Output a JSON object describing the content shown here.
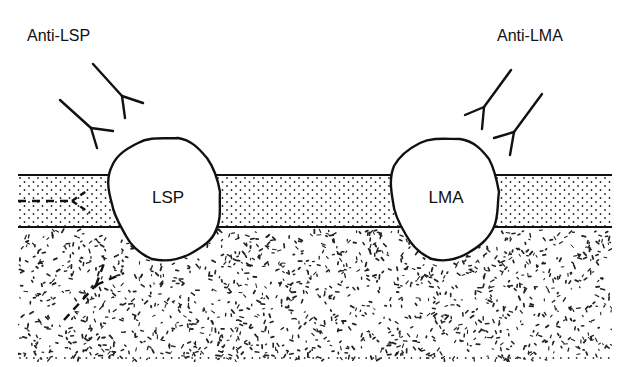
{
  "diagram": {
    "type": "schematic",
    "labels": {
      "anti_lsp": "Anti-LSP",
      "anti_lma": "Anti-LMA",
      "lsp": "LSP",
      "lma": "LMA"
    },
    "colors": {
      "ink": "#111111",
      "background": "#ffffff"
    },
    "layers": [
      {
        "name": "membrane-band",
        "pattern": "fine-dots",
        "top": 175,
        "bottom": 227
      },
      {
        "name": "underlying-matrix",
        "pattern": "random-speckle",
        "top": 227,
        "bottom": 360
      }
    ],
    "antigens": [
      {
        "id": "lsp",
        "label": "LSP",
        "cx": 166,
        "cy": 197
      },
      {
        "id": "lma",
        "label": "LMA",
        "cx": 446,
        "cy": 196
      }
    ],
    "antibodies": [
      {
        "group": "anti-lsp",
        "style": "solid",
        "count": 2
      },
      {
        "group": "anti-lma",
        "style": "solid",
        "count": 2
      },
      {
        "group": "blocked",
        "style": "dashed",
        "count": 2
      }
    ]
  }
}
